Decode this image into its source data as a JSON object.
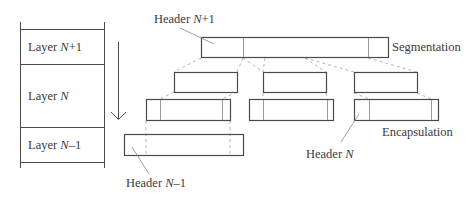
{
  "layers": [
    {
      "prefix": "Layer ",
      "var": "N",
      "suffix": "+1"
    },
    {
      "prefix": "Layer ",
      "var": "N",
      "suffix": ""
    },
    {
      "prefix": "Layer ",
      "var": "N",
      "suffix": "–1"
    }
  ],
  "labels": {
    "header_n_plus_1": {
      "prefix": "Header ",
      "var": "N",
      "suffix": "+1"
    },
    "header_n": {
      "prefix": "Header ",
      "var": "N",
      "suffix": ""
    },
    "header_n_minus_1": {
      "prefix": "Header ",
      "var": "N",
      "suffix": "–1"
    },
    "segmentation": "Segmentation",
    "encapsulation": "Encapsulation"
  },
  "colors": {
    "stroke": "#4a4a4a",
    "divider": "#9a9a9a",
    "dashed": "#b5b5b5"
  }
}
